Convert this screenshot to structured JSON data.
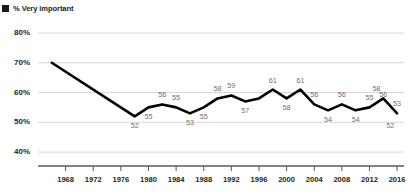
{
  "legend": {
    "marker": "square-marker",
    "label": "% Very important"
  },
  "chart_data": {
    "type": "line",
    "title": "",
    "subtitle": "",
    "xlabel": "",
    "ylabel": "",
    "xlim": [
      1964,
      2017
    ],
    "ylim": [
      40,
      80
    ],
    "grid": true,
    "legend_position": "top-left",
    "yticks": [
      "40%",
      "50%",
      "60%",
      "70%",
      "80%"
    ],
    "ytick_values": [
      40,
      50,
      60,
      70,
      80
    ],
    "xticks": [
      "1968",
      "1972",
      "1976",
      "1980",
      "1984",
      "1988",
      "1992",
      "1996",
      "2000",
      "2004",
      "2008",
      "2012",
      "2016"
    ],
    "xtick_values": [
      1968,
      1972,
      1976,
      1980,
      1984,
      1988,
      1992,
      1996,
      2000,
      2004,
      2008,
      2012,
      2016
    ],
    "series": [
      {
        "name": "% Very important",
        "color": "#000000",
        "x": [
          1966,
          1978,
          1980,
          1982,
          1984,
          1986,
          1988,
          1990,
          1992,
          1994,
          1996,
          1998,
          2000,
          2002,
          2004,
          2006,
          2008,
          2010,
          2012,
          2014,
          2016
        ],
        "values": [
          70,
          52,
          55,
          56,
          55,
          53,
          55,
          58,
          59,
          57,
          58,
          61,
          58,
          61,
          56,
          54,
          56,
          54,
          55,
          58,
          53
        ]
      }
    ],
    "point_labels": [
      {
        "x": 1978,
        "value": 52,
        "position": "below"
      },
      {
        "x": 1980,
        "value": 55,
        "position": "below"
      },
      {
        "x": 1982,
        "value": 56,
        "position": "above"
      },
      {
        "x": 1984,
        "value": 55,
        "position": "above"
      },
      {
        "x": 1986,
        "value": 53,
        "position": "below"
      },
      {
        "x": 1988,
        "value": 55,
        "position": "below"
      },
      {
        "x": 1990,
        "value": 58,
        "position": "above"
      },
      {
        "x": 1992,
        "value": 59,
        "position": "above"
      },
      {
        "x": 1994,
        "value": 57,
        "position": "below"
      },
      {
        "x": 1998,
        "value": 61,
        "position": "above"
      },
      {
        "x": 2000,
        "value": 58,
        "position": "below"
      },
      {
        "x": 2002,
        "value": 61,
        "position": "above"
      },
      {
        "x": 2004,
        "value": 56,
        "position": "above"
      },
      {
        "x": 2006,
        "value": 54,
        "position": "below"
      },
      {
        "x": 2008,
        "value": 56,
        "position": "above"
      },
      {
        "x": 2010,
        "value": 54,
        "position": "below"
      },
      {
        "x": 2012,
        "value": 55,
        "position": "above"
      },
      {
        "x": 2013,
        "value": 58,
        "position": "above"
      },
      {
        "x": 2014,
        "value": 56,
        "position": "above"
      },
      {
        "x": 2015,
        "value": 52,
        "position": "below"
      },
      {
        "x": 2016,
        "value": 53,
        "position": "above"
      }
    ]
  }
}
